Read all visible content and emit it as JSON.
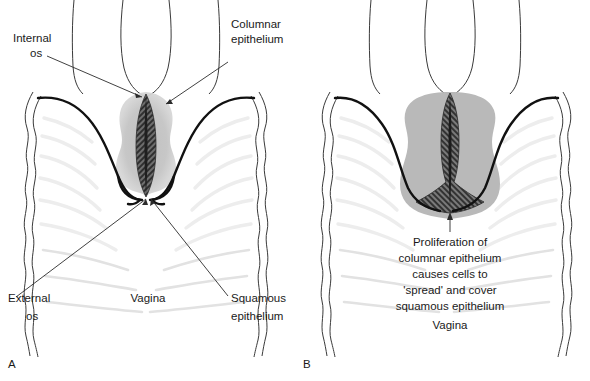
{
  "figure": {
    "panels": [
      {
        "letter": "A",
        "labels": {
          "internal_os": "Internal\nos",
          "internal_os_line1": "Internal",
          "internal_os_line2": "os",
          "columnar_epithelium_line1": "Columnar",
          "columnar_epithelium_line2": "epithelium",
          "external_os_line1": "External",
          "external_os_line2": "os",
          "vagina": "Vagina",
          "squamous_epithelium_line1": "Squamous",
          "squamous_epithelium_line2": "epithelium"
        }
      },
      {
        "letter": "B",
        "labels": {
          "caption_line1": "Proliferation of",
          "caption_line2": "columnar epithelium",
          "caption_line3": "causes cells to",
          "caption_line4": "'spread' and cover",
          "caption_line5": "squamous epithelium",
          "vagina": "Vagina"
        }
      }
    ],
    "colors": {
      "background": "#ffffff",
      "outline_thin": "#3a3a3a",
      "outline_thick": "#111111",
      "cervix_stroma_grey": "#b8b8b8",
      "cervix_stroma_grey_light": "#c9c9c9",
      "columnar_hatch_dark": "#3d3d3d",
      "rugae_grey": "#e6e6e6",
      "text": "#1a1a1a",
      "leader_line": "#2b2b2b"
    }
  }
}
